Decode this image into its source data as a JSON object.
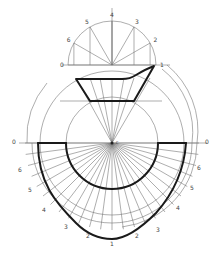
{
  "drawing": {
    "title": "Development of a transition piece (radial line development)",
    "top_semicircle_labels": [
      "0",
      "6",
      "5",
      "4",
      "3",
      "2",
      "1"
    ],
    "left_ray_labels": [
      "0",
      "6",
      "5",
      "4",
      "3",
      "2"
    ],
    "right_ray_labels": [
      "0",
      "6",
      "5",
      "4",
      "3",
      "2"
    ],
    "bottom_label": "1",
    "center_label": "c",
    "colors": {
      "construction": "#777777",
      "outline": "#1a1a1a",
      "background": "#ffffff"
    }
  }
}
